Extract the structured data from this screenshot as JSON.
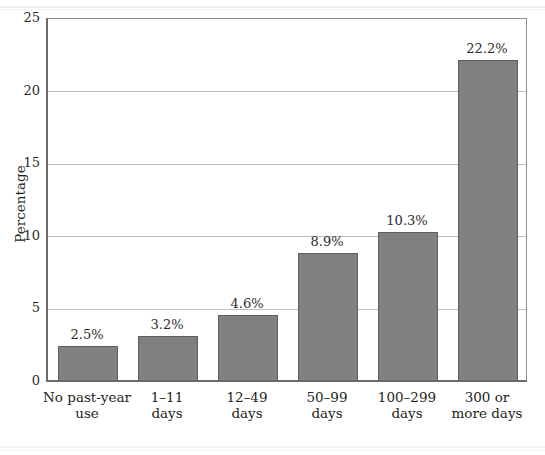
{
  "chart_data": {
    "type": "bar",
    "title": "",
    "subtitle": "",
    "xlabel": "",
    "ylabel": "Percentage",
    "ylim": [
      0,
      25
    ],
    "yticks": [
      0,
      5,
      10,
      15,
      20,
      25
    ],
    "ytick_labels": [
      "0",
      "5",
      "10",
      "15",
      "20",
      "25"
    ],
    "grid": true,
    "gridlines_at": [
      5,
      10,
      15,
      20
    ],
    "legend": null,
    "categories": [
      "No past-year\nuse",
      "1–11\ndays",
      "12–49\ndays",
      "50–99\ndays",
      "100–299\ndays",
      "300 or\nmore days"
    ],
    "values": [
      2.5,
      3.2,
      4.6,
      8.9,
      10.3,
      22.2
    ],
    "value_labels": [
      "2.5%",
      "3.2%",
      "4.6%",
      "8.9%",
      "10.3%",
      "22.2%"
    ],
    "bar_color": "#808080",
    "bar_edge_color": "#5e5e5e",
    "axis_color": "#6a6a6a",
    "gridline_color": "#bdbdbd",
    "text_color": "#231f20"
  }
}
